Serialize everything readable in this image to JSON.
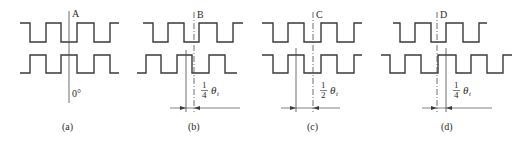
{
  "figure": {
    "levels": {
      "top_high": 23,
      "top_low": 42,
      "bot_high": 55,
      "bot_low": 73
    },
    "panels": [
      {
        "id": "a",
        "caption": "(a)",
        "ref_label": "A",
        "angle_label": "0°",
        "shift_fraction": null,
        "top_wave": {
          "start_x": 20,
          "end_x": 119,
          "start_level": "high",
          "edges": [
            30,
            46,
            61,
            77,
            94,
            110
          ]
        },
        "bottom_wave": {
          "start_x": 20,
          "end_x": 119,
          "start_level": "low",
          "edges": [
            30,
            46,
            61,
            77,
            94,
            110
          ]
        },
        "ref_line": {
          "x": 69,
          "y1": 11,
          "y2": 103,
          "style": "solid"
        },
        "shift_line": null,
        "label_pos": {
          "x": 72,
          "y": 17
        },
        "angle_pos": {
          "x": 72,
          "y": 97
        },
        "caption_pos": {
          "x": 62,
          "y": 130
        }
      },
      {
        "id": "b",
        "caption": "(b)",
        "ref_label": "B",
        "shift_fraction": {
          "num": "1",
          "den": "4",
          "symbol": "θ",
          "sub": "t"
        },
        "top_wave": {
          "start_x": 143,
          "end_x": 243,
          "start_level": "high",
          "edges": [
            153,
            168,
            184,
            199,
            217,
            233
          ]
        },
        "bottom_wave": {
          "start_x": 137,
          "end_x": 237,
          "start_level": "low",
          "edges": [
            146,
            161,
            177,
            192,
            209,
            225
          ]
        },
        "ref_line": {
          "x": 194,
          "y1": 12,
          "y2": 112,
          "style": "dashdot"
        },
        "shift_line": {
          "x": 186,
          "y1": 50,
          "y2": 112
        },
        "dim_line": {
          "y": 108,
          "x1": 170,
          "x2": 240
        },
        "label_pos": {
          "x": 197,
          "y": 18
        },
        "frac_pos": {
          "x": 202,
          "y": 96
        },
        "caption_pos": {
          "x": 188,
          "y": 130
        }
      },
      {
        "id": "c",
        "caption": "(c)",
        "ref_label": "C",
        "shift_fraction": {
          "num": "1",
          "den": "2",
          "symbol": "θ",
          "sub": "t"
        },
        "top_wave": {
          "start_x": 262,
          "end_x": 362,
          "start_level": "high",
          "edges": [
            273,
            288,
            304,
            321,
            337,
            354
          ]
        },
        "bottom_wave": {
          "start_x": 262,
          "end_x": 362,
          "start_level": "high",
          "edges": [
            273,
            288,
            304,
            321,
            337,
            354
          ]
        },
        "ref_line": {
          "x": 313,
          "y1": 12,
          "y2": 112,
          "style": "dashdot"
        },
        "shift_line": {
          "x": 296,
          "y1": 48,
          "y2": 112
        },
        "dim_line": {
          "y": 108,
          "x1": 281,
          "x2": 340
        },
        "label_pos": {
          "x": 316,
          "y": 18
        },
        "frac_pos": {
          "x": 321,
          "y": 96
        },
        "caption_pos": {
          "x": 307,
          "y": 130
        }
      },
      {
        "id": "d",
        "caption": "(d)",
        "ref_label": "D",
        "shift_fraction": {
          "num": "1",
          "den": "4",
          "symbol": "θ",
          "sub": "t"
        },
        "top_wave": {
          "start_x": 393,
          "end_x": 487,
          "start_level": "high",
          "edges": [
            400,
            415,
            431,
            446,
            463,
            479
          ]
        },
        "bottom_wave": {
          "start_x": 381,
          "end_x": 512,
          "start_level": "high",
          "edges": [
            390,
            405,
            421,
            438,
            456,
            471,
            487,
            503
          ]
        },
        "ref_line": {
          "x": 437,
          "y1": 12,
          "y2": 112,
          "style": "dashdot"
        },
        "shift_line": {
          "x": 446,
          "y1": 48,
          "y2": 112
        },
        "dim_line": {
          "y": 108,
          "x1": 422,
          "x2": 492
        },
        "label_pos": {
          "x": 440,
          "y": 18
        },
        "frac_pos": {
          "x": 454,
          "y": 96
        },
        "caption_pos": {
          "x": 441,
          "y": 130
        }
      }
    ]
  }
}
